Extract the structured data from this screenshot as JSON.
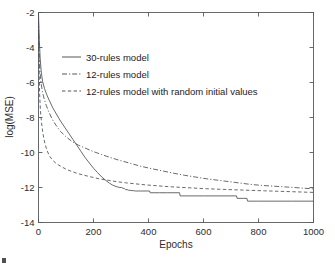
{
  "chart_data": {
    "type": "line",
    "title": "",
    "xlabel": "Epochs",
    "ylabel": "log(MSE)",
    "xlim": [
      0,
      1000
    ],
    "ylim": [
      -14,
      -2
    ],
    "xticks": [
      0,
      200,
      400,
      600,
      800,
      1000
    ],
    "yticks": [
      -2,
      -4,
      -6,
      -8,
      -10,
      -12,
      -14
    ],
    "xtick_labels": [
      "0",
      "200",
      "400",
      "600",
      "800",
      "1000"
    ],
    "ytick_labels": [
      "-2",
      "-4",
      "-6",
      "-8",
      "-10",
      "-12",
      "-14"
    ],
    "grid": false,
    "legend_position": "upper-left-inside",
    "line_color": "#4a4f54",
    "frame_color": "#555a5e",
    "background": "#ffffff",
    "series": [
      {
        "name": "30-rules model",
        "style": "solid",
        "dash": "none",
        "x": [
          0,
          3,
          6,
          10,
          15,
          22,
          30,
          40,
          52,
          65,
          80,
          95,
          110,
          125,
          140,
          155,
          170,
          185,
          200,
          215,
          230,
          245,
          258,
          268,
          278,
          288,
          296,
          302,
          308,
          312,
          316,
          322,
          328,
          334,
          340,
          346,
          352,
          360,
          370,
          380,
          392,
          404,
          406,
          408,
          420,
          440,
          470,
          500,
          513,
          515,
          540,
          600,
          660,
          700,
          720,
          722,
          745,
          758,
          760,
          800,
          860,
          920,
          1000
        ],
        "y": [
          -2.05,
          -3.6,
          -4.6,
          -5.4,
          -5.95,
          -6.35,
          -6.7,
          -7.05,
          -7.45,
          -7.8,
          -8.2,
          -8.55,
          -8.9,
          -9.25,
          -9.6,
          -9.95,
          -10.3,
          -10.6,
          -10.9,
          -11.15,
          -11.4,
          -11.6,
          -11.75,
          -11.85,
          -11.92,
          -11.97,
          -12.0,
          -12.0,
          -12.05,
          -12.05,
          -12.12,
          -12.12,
          -12.16,
          -12.16,
          -12.18,
          -12.18,
          -12.2,
          -12.2,
          -12.2,
          -12.2,
          -12.2,
          -12.2,
          -12.3,
          -12.3,
          -12.3,
          -12.3,
          -12.3,
          -12.3,
          -12.3,
          -12.48,
          -12.48,
          -12.48,
          -12.48,
          -12.48,
          -12.48,
          -12.62,
          -12.62,
          -12.62,
          -12.78,
          -12.78,
          -12.78,
          -12.78,
          -12.78
        ]
      },
      {
        "name": "12-rules model",
        "style": "dash-dot",
        "dash": "5,2,1.2,2",
        "x": [
          0,
          2,
          5,
          9,
          14,
          20,
          28,
          38,
          50,
          64,
          80,
          100,
          120,
          145,
          170,
          200,
          230,
          260,
          295,
          330,
          370,
          410,
          450,
          490,
          530,
          570,
          610,
          650,
          690,
          730,
          770,
          810,
          850,
          890,
          930,
          965,
          1000
        ],
        "y": [
          -2.6,
          -4.2,
          -5.3,
          -6.0,
          -6.5,
          -6.9,
          -7.3,
          -7.7,
          -8.1,
          -8.45,
          -8.8,
          -9.1,
          -9.35,
          -9.58,
          -9.75,
          -9.95,
          -10.12,
          -10.28,
          -10.45,
          -10.6,
          -10.78,
          -10.92,
          -11.05,
          -11.18,
          -11.3,
          -11.4,
          -11.5,
          -11.58,
          -11.66,
          -11.74,
          -11.82,
          -11.88,
          -11.92,
          -11.96,
          -12.0,
          -12.04,
          -12.08
        ]
      },
      {
        "name": "12-rules model with random initial values",
        "style": "dashed",
        "dash": "3.4,2.4",
        "x": [
          0,
          2,
          4,
          7,
          11,
          16,
          22,
          30,
          40,
          52,
          66,
          82,
          100,
          120,
          142,
          166,
          192,
          220,
          250,
          282,
          316,
          352,
          390,
          430,
          472,
          516,
          562,
          610,
          660,
          712,
          766,
          822,
          880,
          940,
          1000
        ],
        "y": [
          -3.0,
          -5.0,
          -6.6,
          -7.6,
          -8.3,
          -8.9,
          -9.4,
          -9.85,
          -10.2,
          -10.45,
          -10.65,
          -10.8,
          -10.95,
          -11.08,
          -11.2,
          -11.3,
          -11.4,
          -11.5,
          -11.58,
          -11.66,
          -11.73,
          -11.79,
          -11.85,
          -11.9,
          -11.95,
          -11.99,
          -12.03,
          -12.07,
          -12.1,
          -12.13,
          -12.16,
          -12.19,
          -12.22,
          -12.25,
          -12.28
        ]
      }
    ],
    "legend": [
      {
        "label": "30-rules model",
        "style": "solid",
        "dash": "none"
      },
      {
        "label": "12-rules model",
        "style": "dash-dot",
        "dash": "5,2,1.2,2"
      },
      {
        "label": "12-rules model with random initial values",
        "style": "dashed",
        "dash": "3.4,2.4"
      }
    ]
  }
}
